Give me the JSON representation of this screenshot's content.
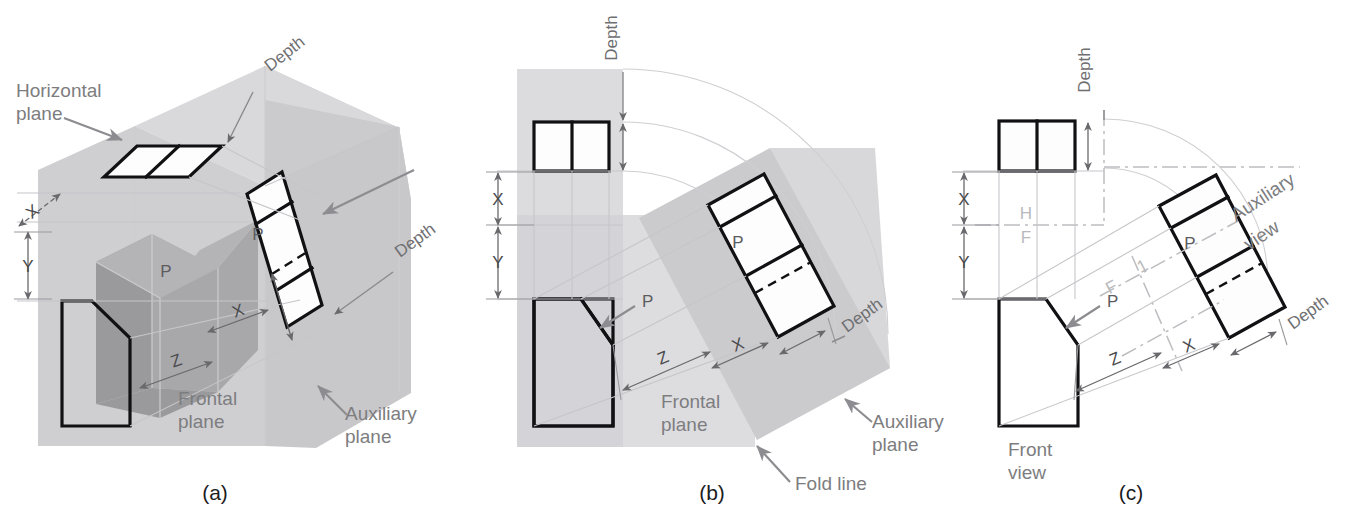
{
  "figure": {
    "captions": {
      "a": "(a)",
      "b": "(b)",
      "c": "(c)"
    }
  },
  "panel_a": {
    "labels": {
      "horizontal_plane": "Horizontal\nplane",
      "horizontal_plane_line1": "Horizontal",
      "horizontal_plane_line2": "plane",
      "frontal_plane_line1": "Frontal",
      "frontal_plane_line2": "plane",
      "auxiliary_plane_line1": "Auxiliary",
      "auxiliary_plane_line2": "plane",
      "depth_top": "Depth",
      "depth_right": "Depth",
      "surface_p_solid": "P",
      "surface_p_aux": "P",
      "dim_x_upper": "X",
      "dim_y": "Y",
      "dim_x_lower": "X",
      "dim_z": "Z"
    }
  },
  "panel_b": {
    "labels": {
      "depth_top": "Depth",
      "depth_right": "Depth",
      "frontal_plane_line1": "Frontal",
      "frontal_plane_line2": "plane",
      "auxiliary_plane_line1": "Auxiliary",
      "auxiliary_plane_line2": "plane",
      "fold_line": "Fold line",
      "surface_p_front": "P",
      "surface_p_aux": "P",
      "dim_x_upper": "X",
      "dim_y": "Y",
      "dim_x_lower": "X",
      "dim_z": "Z"
    }
  },
  "panel_c": {
    "labels": {
      "depth_top": "Depth",
      "depth_right": "Depth",
      "front_view_line1": "Front",
      "front_view_line2": "view",
      "auxiliary_view_line1": "Auxiliary",
      "auxiliary_view_line2": "view",
      "fold_h": "H",
      "fold_f": "F",
      "fold_f2": "F",
      "fold_1": "1",
      "surface_p_front": "P",
      "surface_p_aux": "P",
      "dim_x_upper": "X",
      "dim_y": "Y",
      "dim_x_lower": "X",
      "dim_z": "Z"
    }
  },
  "colors": {
    "background": "#ffffff",
    "object_line": "#111114",
    "plane_horizontal": "#d9d9dc",
    "plane_frontal": "#cfcfd2",
    "plane_auxiliary": "#c8c8cb",
    "solid_shade": "#9a9a9d",
    "label_gray": "#7d7d80",
    "fold_line_gray": "#bdbdc1",
    "projection_gray": "#c6c6ca",
    "caption": "#1c1c1e"
  }
}
